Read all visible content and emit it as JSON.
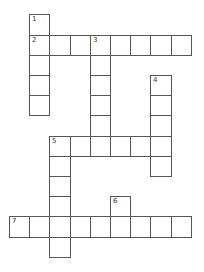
{
  "puzzle": {
    "type": "crossword",
    "cell_size": 20.2,
    "origin": {
      "x": 9,
      "y": 14.3
    },
    "border_color": "#555555",
    "background": "#ffffff",
    "entries": [
      {
        "number": "1",
        "direction": "down",
        "row": 0,
        "col": 1,
        "length": 5
      },
      {
        "number": "2",
        "direction": "across",
        "row": 1,
        "col": 1,
        "length": 8
      },
      {
        "number": "3",
        "direction": "down",
        "row": 1,
        "col": 4,
        "length": 6
      },
      {
        "number": "4",
        "direction": "down",
        "row": 3,
        "col": 7,
        "length": 5
      },
      {
        "number": "5",
        "direction": "across",
        "row": 6,
        "col": 2,
        "length": 6
      },
      {
        "number": "5",
        "direction": "down",
        "row": 6,
        "col": 2,
        "length": 6
      },
      {
        "number": "6",
        "direction": "down",
        "row": 9,
        "col": 5,
        "length": 2
      },
      {
        "number": "7",
        "direction": "across",
        "row": 10,
        "col": 0,
        "length": 9
      }
    ]
  }
}
